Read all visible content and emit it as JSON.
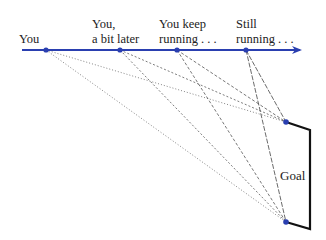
{
  "labels": {
    "you": "You",
    "later_line1": "You,",
    "later_line2": "a bit later",
    "keep_line1": "You keep",
    "keep_line2": "running . . .",
    "still_line1": "Still",
    "still_line2": "running . . .",
    "goal": "Goal"
  },
  "colors": {
    "trajectory": "#2a3fb0",
    "points": "#2a3fb0",
    "sight_lines": "#555555",
    "goal": "#111111"
  },
  "trajectory": {
    "start": [
      22,
      50
    ],
    "end": [
      302,
      50
    ],
    "positions": [
      {
        "name": "You",
        "x": 46,
        "y": 50
      },
      {
        "name": "You, a bit later",
        "x": 120,
        "y": 50
      },
      {
        "name": "You keep running",
        "x": 177,
        "y": 50
      },
      {
        "name": "Still running",
        "x": 246,
        "y": 50
      }
    ]
  },
  "goal": {
    "top_post": [
      286,
      122
    ],
    "bottom_post": [
      286,
      222
    ],
    "frame_right_x": 310
  }
}
